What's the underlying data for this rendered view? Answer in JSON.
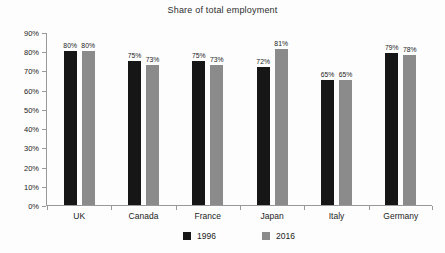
{
  "chart_data": {
    "type": "bar",
    "title": "Share of total employment",
    "categories": [
      "UK",
      "Canada",
      "France",
      "Japan",
      "Italy",
      "Germany"
    ],
    "series": [
      {
        "name": "1996",
        "color": "#161616",
        "values": [
          80,
          75,
          75,
          72,
          65,
          79
        ]
      },
      {
        "name": "2016",
        "color": "#8b8b8b",
        "values": [
          80,
          73,
          73,
          81,
          65,
          78
        ]
      }
    ],
    "value_label_suffix": "%",
    "xlabel": "",
    "ylabel": "",
    "ylim": [
      0,
      90
    ],
    "ytick_step": 10,
    "ytick_labels": [
      "0%",
      "10%",
      "20%",
      "30%",
      "40%",
      "50%",
      "60%",
      "70%",
      "80%",
      "90%"
    ],
    "grid": false,
    "legend_position": "bottom",
    "axis_color": "#999999",
    "text_color": "#1c1c1c"
  }
}
